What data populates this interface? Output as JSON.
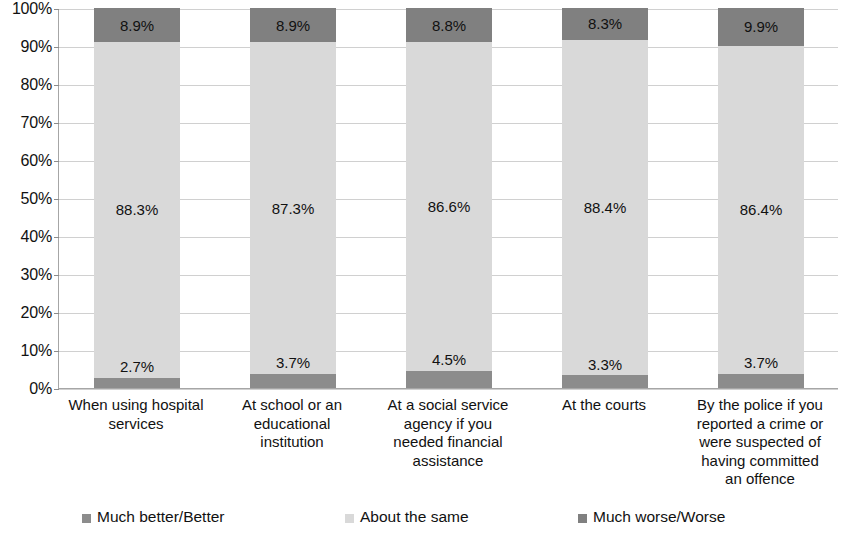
{
  "chart_data": {
    "type": "bar",
    "subtype": "stacked-100-percent",
    "title": "",
    "xlabel": "",
    "ylabel": "",
    "ylim": [
      0,
      100
    ],
    "ytick_labels": [
      "100%",
      "90%",
      "80%",
      "70%",
      "60%",
      "50%",
      "40%",
      "30%",
      "20%",
      "10%",
      "0%"
    ],
    "ytick_values": [
      100,
      90,
      80,
      70,
      60,
      50,
      40,
      30,
      20,
      10,
      0
    ],
    "grid": true,
    "legend_position": "bottom",
    "categories": [
      "When using hospital services",
      "At school or an educational institution",
      "At a social service agency if you needed financial assistance",
      "At the courts",
      "By the police if you reported a crime or were suspected of having committed an offence"
    ],
    "category_lines": [
      [
        "When using hospital",
        "services"
      ],
      [
        "At school or an",
        "educational",
        "institution"
      ],
      [
        "At a social service",
        "agency if you",
        "needed financial",
        "assistance"
      ],
      [
        "At the courts"
      ],
      [
        "By the police if you",
        "reported a crime or",
        "were suspected of",
        "having committed",
        "an offence"
      ]
    ],
    "series": [
      {
        "name": "Much better/Better",
        "color": "#8c8c8c",
        "values": [
          2.7,
          3.7,
          4.5,
          3.3,
          3.7
        ],
        "labels": [
          "2.7%",
          "3.7%",
          "4.5%",
          "3.3%",
          "3.7%"
        ]
      },
      {
        "name": "About the same",
        "color": "#d9d9d9",
        "values": [
          88.3,
          87.3,
          86.6,
          88.4,
          86.4
        ],
        "labels": [
          "88.3%",
          "87.3%",
          "86.6%",
          "88.4%",
          "86.4%"
        ]
      },
      {
        "name": "Much worse/Worse",
        "color": "#808080",
        "values": [
          8.9,
          8.9,
          8.8,
          8.3,
          9.9
        ],
        "labels": [
          "8.9%",
          "8.9%",
          "8.8%",
          "8.3%",
          "9.9%"
        ]
      }
    ]
  },
  "legend": {
    "items": [
      {
        "label": "Much better/Better",
        "swatch_color": "#8c8c8c",
        "swatch_icon": "legend-square-icon"
      },
      {
        "label": "About the same",
        "swatch_color": "#d9d9d9",
        "swatch_icon": "legend-square-icon"
      },
      {
        "label": "Much worse/Worse",
        "swatch_color": "#808080",
        "swatch_icon": "legend-square-icon"
      }
    ]
  },
  "colors": {
    "much_better": "#8c8c8c",
    "about_the_same": "#d9d9d9",
    "much_worse": "#808080",
    "gridline": "#d0d0d0",
    "axis": "#a6a6a6",
    "text": "#111111",
    "background": "#ffffff"
  }
}
